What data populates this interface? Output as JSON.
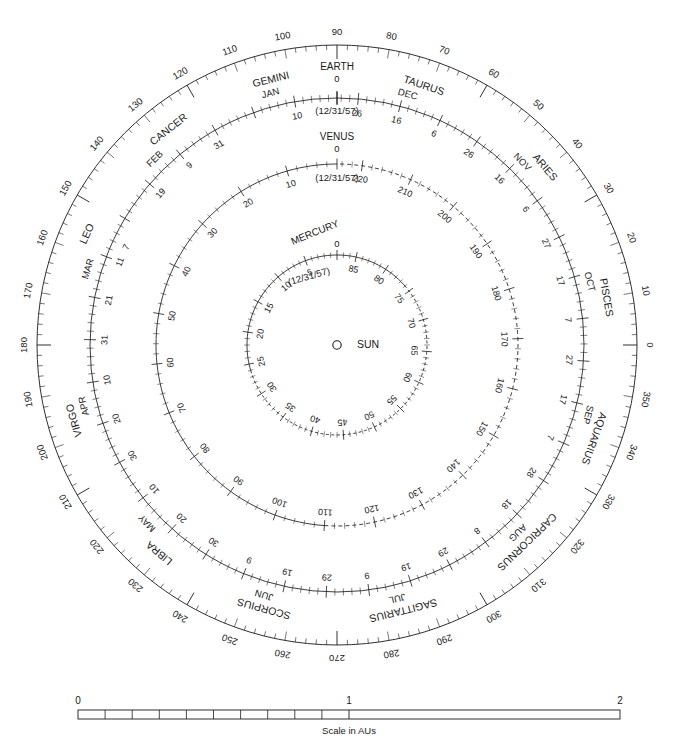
{
  "chart_data": {
    "type": "polar",
    "center": {
      "x": 337,
      "y": 345
    },
    "sun": {
      "label": "SUN",
      "marker": "open-circle"
    },
    "rings": [
      {
        "name": "zodiac",
        "kind": "degrees",
        "radius": 300,
        "tick_radius_inner": 288,
        "zero_at": "right",
        "direction": "counterclockwise",
        "major_step": 10,
        "minor_step": 2,
        "labels": [
          0,
          10,
          20,
          30,
          40,
          50,
          60,
          70,
          80,
          90,
          100,
          110,
          120,
          130,
          140,
          150,
          160,
          170,
          180,
          190,
          200,
          210,
          220,
          230,
          240,
          250,
          260,
          270,
          280,
          290,
          300,
          310,
          320,
          330,
          340,
          350
        ],
        "constellations": [
          {
            "name": "ARIES",
            "start": 28,
            "end": 53
          },
          {
            "name": "TAURUS",
            "start": 53,
            "end": 90
          },
          {
            "name": "GEMINI",
            "start": 90,
            "end": 118
          },
          {
            "name": "CANCER",
            "start": 118,
            "end": 138
          },
          {
            "name": "LEO",
            "start": 138,
            "end": 174
          },
          {
            "name": "VIRGO",
            "start": 174,
            "end": 218
          },
          {
            "name": "LIBRA",
            "start": 218,
            "end": 241
          },
          {
            "name": "SCORPIUS",
            "start": 241,
            "end": 268
          },
          {
            "name": "SAGITTARIUS",
            "start": 268,
            "end": 300
          },
          {
            "name": "CAPRICORNUS",
            "start": 300,
            "end": 328
          },
          {
            "name": "AQUARIUS",
            "start": 328,
            "end": 352
          },
          {
            "name": "PISCES",
            "start": 352,
            "end": 388
          }
        ]
      },
      {
        "name": "earth",
        "kind": "days",
        "planet_label": "EARTH",
        "epoch_label": "(12/31/57)",
        "epoch_value": "0",
        "radius": 247,
        "zero_at": "top",
        "direction": "counterclockwise",
        "total": 365,
        "major_step": 10,
        "minor_step": 2,
        "day_labels": [
          10,
          20,
          30,
          40,
          50,
          60,
          70,
          80,
          90,
          100,
          110,
          120,
          130,
          140,
          150,
          160,
          170,
          180,
          190,
          200,
          210,
          220,
          230,
          240,
          250,
          260,
          270,
          280,
          290,
          300,
          310,
          320,
          330,
          340,
          350,
          360
        ],
        "months": [
          {
            "name": "JAN",
            "day": 15,
            "marks": [
              10,
              31
            ]
          },
          {
            "name": "FEB",
            "day": 45,
            "marks": [
              9,
              19
            ]
          },
          {
            "name": "MAR",
            "day": 74,
            "marks": [
              7,
              11,
              21,
              31
            ]
          },
          {
            "name": "APR",
            "day": 105,
            "marks": [
              10,
              20,
              30
            ]
          },
          {
            "name": "MAY",
            "day": 135,
            "marks": [
              10,
              20,
              30
            ]
          },
          {
            "name": "JUN",
            "day": 166,
            "marks": [
              9,
              19,
              29
            ]
          },
          {
            "name": "JUL",
            "day": 196,
            "marks": [
              9,
              19,
              29
            ]
          },
          {
            "name": "AUG",
            "day": 227,
            "marks": [
              8,
              18,
              28
            ]
          },
          {
            "name": "SEP",
            "day": 258,
            "marks": [
              7,
              17,
              27
            ]
          },
          {
            "name": "OCT",
            "day": 288,
            "marks": [
              7,
              17,
              27
            ]
          },
          {
            "name": "NOV",
            "day": 319,
            "marks": [
              6,
              16,
              26
            ]
          },
          {
            "name": "DEC",
            "day": 349,
            "marks": [
              6,
              16,
              26
            ]
          }
        ]
      },
      {
        "name": "venus",
        "kind": "days",
        "planet_label": "VENUS",
        "epoch_label": "(12/31/57)",
        "epoch_value": "0",
        "radius": 181,
        "zero_at": "top",
        "direction": "counterclockwise",
        "total": 225,
        "major_step": 10,
        "minor_step": 2,
        "dash_from": 110,
        "dash_to": 225,
        "day_labels": [
          10,
          20,
          30,
          40,
          50,
          60,
          70,
          80,
          90,
          100,
          110,
          120,
          130,
          140,
          150,
          160,
          170,
          180,
          190,
          200,
          210,
          220
        ]
      },
      {
        "name": "mercury",
        "kind": "days",
        "planet_label": "MERCURY",
        "epoch_label": "(12/31/57)",
        "epoch_value": "0",
        "radius": 90,
        "zero_at": "top",
        "direction": "counterclockwise",
        "total": 88,
        "major_step": 5,
        "minor_step": 1,
        "dash_from": 26,
        "dash_to": 76,
        "day_labels": [
          5,
          10,
          15,
          20,
          25,
          30,
          35,
          40,
          45,
          50,
          55,
          60,
          65,
          70,
          75,
          80,
          85
        ]
      }
    ]
  },
  "scale": {
    "caption": "Scale in AUs",
    "min_label": "0",
    "mid_label": "1",
    "max_label": "2",
    "subdivisions": 10
  },
  "colors": {
    "ink": "#1a1a1a",
    "line": "#333333",
    "background": "#ffffff"
  }
}
